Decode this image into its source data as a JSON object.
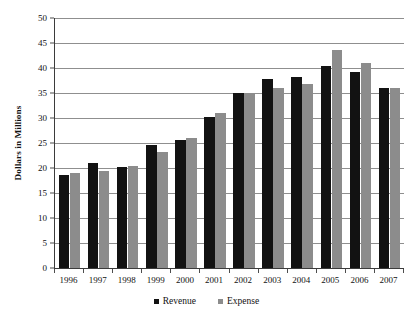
{
  "chart_data": {
    "type": "bar",
    "title": "",
    "subtitle": "",
    "xlabel": "",
    "ylabel": "Dollars in Millions",
    "ylim": [
      0,
      50
    ],
    "ytick_step": 5,
    "yticks": [
      "0",
      "5",
      "10",
      "15",
      "20",
      "25",
      "30",
      "35",
      "40",
      "45",
      "50"
    ],
    "grid": "horizontal",
    "legend_position": "bottom-center",
    "categories": [
      "1996",
      "1997",
      "1998",
      "1999",
      "2000",
      "2001",
      "2002",
      "2003",
      "2004",
      "2005",
      "2006",
      "2007"
    ],
    "series": [
      {
        "name": "Revenue",
        "color": "#121212",
        "values": [
          18.7,
          21.0,
          20.3,
          24.7,
          25.6,
          30.2,
          35.0,
          37.8,
          38.3,
          40.5,
          39.3,
          36.0
        ]
      },
      {
        "name": "Expense",
        "color": "#8c8c8c",
        "values": [
          19.0,
          19.5,
          20.5,
          23.2,
          26.1,
          31.0,
          35.0,
          36.0,
          36.9,
          43.6,
          41.0,
          36.0
        ]
      }
    ],
    "annotations": []
  },
  "axis": {
    "y_title": "Dollars in Millions"
  },
  "legend": {
    "items": [
      {
        "label": "Revenue",
        "color": "#121212"
      },
      {
        "label": "Expense",
        "color": "#8c8c8c"
      }
    ]
  }
}
